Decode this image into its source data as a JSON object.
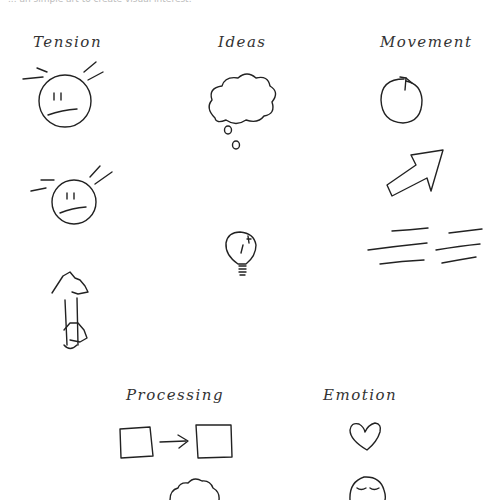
{
  "header": {
    "cutoff_text": "... an simple art to create visual interest."
  },
  "sections": [
    {
      "label": "Tension",
      "icons": [
        "tense-face-icon",
        "tense-face-small-icon",
        "hands-pulling-bar-icon"
      ]
    },
    {
      "label": "Ideas",
      "icons": [
        "thought-cloud-icon",
        "light-bulb-icon"
      ]
    },
    {
      "label": "Movement",
      "icons": [
        "circular-arrow-icon",
        "diagonal-arrow-icon",
        "speed-lines-icon"
      ]
    },
    {
      "label": "Processing",
      "icons": [
        "box-arrow-box-icon",
        "cloud-icon"
      ]
    },
    {
      "label": "Emotion",
      "icons": [
        "heart-icon",
        "calm-face-icon"
      ]
    }
  ],
  "colors": {
    "ink": "#222222",
    "background": "#ffffff"
  }
}
